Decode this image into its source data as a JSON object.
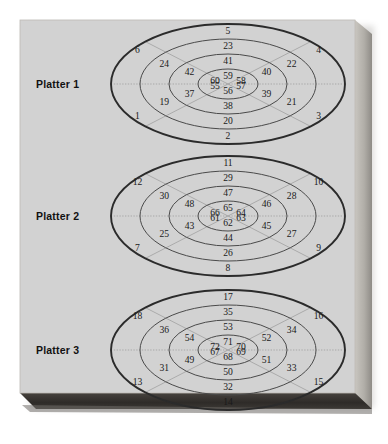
{
  "figure": {
    "background_color": "#d2d2d2",
    "page_color": "#ffffff",
    "edge_color": "#3a3734",
    "side_color": "#b5b2ac",
    "ring_stroke": "#4a4a4a",
    "outer_stroke": "#2b2b2b",
    "sector_stroke": "#9a9a9a",
    "text_color": "#1a1a1a"
  },
  "platters": [
    {
      "label": "Platter 1",
      "cx": 228,
      "cy": 84,
      "rings": [
        {
          "rx": 117,
          "ry": 60
        },
        {
          "rx": 88,
          "ry": 45
        },
        {
          "rx": 59,
          "ry": 30
        },
        {
          "rx": 30,
          "ry": 15
        }
      ],
      "blocks": {
        "top": [
          5,
          23,
          41,
          59
        ],
        "bottom": [
          2,
          20,
          38,
          56
        ],
        "left_upper": [
          6,
          24,
          42,
          60
        ],
        "left_lower": [
          1,
          19,
          37,
          55
        ],
        "right_upper": [
          4,
          22,
          40,
          58
        ],
        "right_lower": [
          3,
          21,
          39,
          57
        ]
      }
    },
    {
      "label": "Platter 2",
      "cx": 228,
      "cy": 216,
      "rings": [
        {
          "rx": 117,
          "ry": 60
        },
        {
          "rx": 88,
          "ry": 45
        },
        {
          "rx": 59,
          "ry": 30
        },
        {
          "rx": 30,
          "ry": 15
        }
      ],
      "blocks": {
        "top": [
          11,
          29,
          47,
          65
        ],
        "bottom": [
          8,
          26,
          44,
          62
        ],
        "left_upper": [
          12,
          30,
          48,
          66
        ],
        "left_lower": [
          7,
          25,
          43,
          61
        ],
        "right_upper": [
          10,
          28,
          46,
          64
        ],
        "right_lower": [
          9,
          27,
          45,
          63
        ]
      }
    },
    {
      "label": "Platter 3",
      "cx": 228,
      "cy": 350,
      "rings": [
        {
          "rx": 117,
          "ry": 60
        },
        {
          "rx": 88,
          "ry": 45
        },
        {
          "rx": 59,
          "ry": 30
        },
        {
          "rx": 30,
          "ry": 15
        }
      ],
      "blocks": {
        "top": [
          17,
          35,
          53,
          71
        ],
        "bottom": [
          14,
          32,
          50,
          68
        ],
        "left_upper": [
          18,
          36,
          54,
          72
        ],
        "left_lower": [
          13,
          31,
          49,
          67
        ],
        "right_upper": [
          16,
          34,
          52,
          70
        ],
        "right_lower": [
          15,
          33,
          51,
          69
        ]
      }
    }
  ],
  "labels": {
    "platter_1": "Platter 1",
    "platter_2": "Platter 2",
    "platter_3": "Platter 3"
  },
  "chart_data": {
    "type": "diagram",
    "platter_count": 3,
    "tracks_per_platter": 4,
    "sectors_per_platter": 8,
    "block_range": [
      1,
      72
    ],
    "platter_1_blocks": [
      5,
      23,
      41,
      59,
      2,
      20,
      38,
      56,
      6,
      24,
      42,
      60,
      1,
      19,
      37,
      55,
      4,
      22,
      40,
      58,
      3,
      21,
      39,
      57
    ],
    "platter_2_blocks": [
      11,
      29,
      47,
      65,
      8,
      26,
      44,
      62,
      12,
      30,
      48,
      66,
      7,
      25,
      43,
      61,
      10,
      28,
      46,
      64,
      9,
      27,
      45,
      63
    ],
    "platter_3_blocks": [
      17,
      35,
      53,
      71,
      14,
      32,
      50,
      68,
      18,
      36,
      54,
      72,
      13,
      31,
      49,
      67,
      16,
      34,
      52,
      70,
      15,
      33,
      51,
      69
    ]
  }
}
